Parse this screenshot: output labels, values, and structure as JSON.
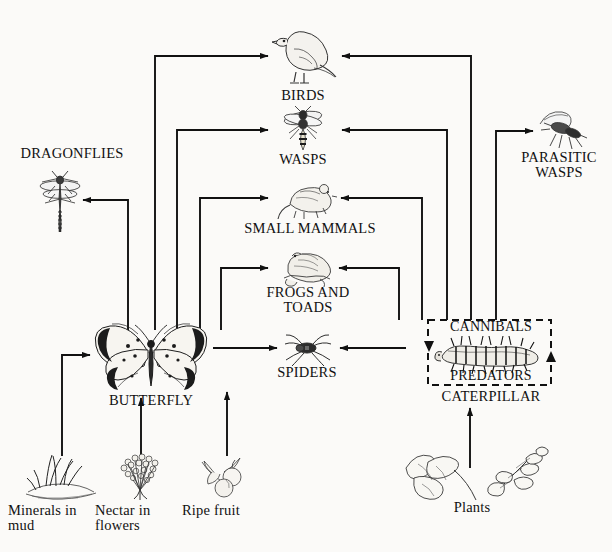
{
  "diagram": {
    "background_color": "#fbfaf8",
    "line_color": "#111111",
    "nodes": {
      "dragonflies": {
        "label": "DRAGONFLIES",
        "icon": "dragonfly-icon"
      },
      "birds": {
        "label": "BIRDS",
        "icon": "bird-icon"
      },
      "wasps": {
        "label": "WASPS",
        "icon": "wasp-icon"
      },
      "parasitic_wasps": {
        "label": "PARASITIC\nWASPS",
        "icon": "parasitic-wasp-icon"
      },
      "small_mammals": {
        "label": "SMALL MAMMALS",
        "icon": "mouse-icon"
      },
      "frogs_and_toads": {
        "label": "FROGS AND\nTOADS",
        "icon": "frog-icon"
      },
      "spiders": {
        "label": "SPIDERS",
        "icon": "spider-icon"
      },
      "butterfly": {
        "label": "BUTTERFLY",
        "icon": "butterfly-icon"
      },
      "caterpillar": {
        "label": "CATERPILLAR",
        "icon": "caterpillar-icon",
        "box_top_label": "CANNIBALS",
        "box_bottom_label": "PREDATORS",
        "box_style": "dashed"
      },
      "minerals_in_mud": {
        "label": "Minerals in\nmud",
        "icon": "mud-icon"
      },
      "nectar_in_flowers": {
        "label": "Nectar in\nflowers",
        "icon": "flowers-icon"
      },
      "ripe_fruit": {
        "label": "Ripe fruit",
        "icon": "fruit-icon"
      },
      "plants": {
        "label": "Plants",
        "icon": "plants-icon"
      }
    },
    "edges": [
      {
        "from": "butterfly",
        "to": "birds"
      },
      {
        "from": "butterfly",
        "to": "wasps"
      },
      {
        "from": "butterfly",
        "to": "small_mammals"
      },
      {
        "from": "butterfly",
        "to": "frogs_and_toads"
      },
      {
        "from": "butterfly",
        "to": "spiders"
      },
      {
        "from": "butterfly",
        "to": "dragonflies"
      },
      {
        "from": "caterpillar",
        "to": "birds"
      },
      {
        "from": "caterpillar",
        "to": "wasps"
      },
      {
        "from": "caterpillar",
        "to": "small_mammals"
      },
      {
        "from": "caterpillar",
        "to": "frogs_and_toads"
      },
      {
        "from": "caterpillar",
        "to": "spiders"
      },
      {
        "from": "caterpillar",
        "to": "parasitic_wasps"
      },
      {
        "from": "minerals_in_mud",
        "to": "butterfly"
      },
      {
        "from": "nectar_in_flowers",
        "to": "butterfly"
      },
      {
        "from": "ripe_fruit",
        "to": "butterfly"
      },
      {
        "from": "plants",
        "to": "caterpillar"
      }
    ]
  }
}
